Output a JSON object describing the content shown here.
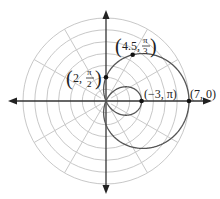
{
  "chart_data": {
    "type": "line",
    "subtype": "polar",
    "title": "",
    "equation_family": "limacon r = 2 + 5cos(theta)",
    "function": {
      "a": 2,
      "b": 5
    },
    "rings": [
      1,
      2,
      3,
      4,
      5,
      6,
      7
    ],
    "rlim": [
      0,
      7
    ],
    "radial_lines_deg": [
      0,
      30,
      60,
      90,
      120,
      150,
      180,
      210,
      240,
      270,
      300,
      330
    ],
    "grid": true,
    "points": [
      {
        "r": 7,
        "theta": 0,
        "label_r": "7",
        "label_theta": "0"
      },
      {
        "r": 4.5,
        "theta": 1.0472,
        "label_r": "4.5",
        "label_theta_num": "π",
        "label_theta_den": "3"
      },
      {
        "r": 2,
        "theta": 1.5708,
        "label_r": "2",
        "label_theta_num": "π",
        "label_theta_den": "2"
      },
      {
        "r": -3,
        "theta": 3.1416,
        "label_r": "−3",
        "label_theta": "π"
      }
    ],
    "colors": {
      "curve": "#555555",
      "grid": "#c8c8c8",
      "axis": "#333333",
      "point": "#111111"
    }
  }
}
